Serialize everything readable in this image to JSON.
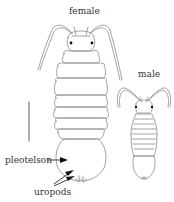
{
  "figure": {
    "labels": {
      "female": "female",
      "male": "male",
      "pleotelson": "pleotelson",
      "uropods": "uropods"
    },
    "scale_bar": {
      "present": true
    },
    "colors": {
      "line": "#8a8a8a",
      "text": "#333333",
      "eye": "#111111",
      "arrow": "#111111",
      "background": "#ffffff"
    }
  }
}
